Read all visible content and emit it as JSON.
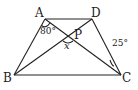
{
  "diagram": {
    "type": "trapezoid with diagonals",
    "points": {
      "A": {
        "label": "A"
      },
      "D": {
        "label": "D"
      },
      "B": {
        "label": "B"
      },
      "C": {
        "label": "C"
      },
      "P": {
        "label": "P"
      }
    },
    "angles": {
      "angle_A": "80°",
      "angle_P": "x",
      "angle_C": "25°"
    },
    "stroke_color": "#222222"
  }
}
